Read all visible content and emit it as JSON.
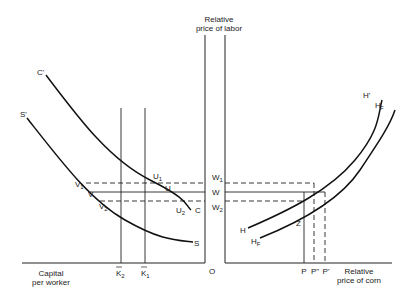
{
  "diagram": {
    "axes": {
      "vertical_label_line1": "Relative",
      "vertical_label_line2": "price of labor",
      "left_x_label_line1": "Capital",
      "left_x_label_line2": "per worker",
      "right_x_label_line1": "Relative",
      "right_x_label_line2": "price of corn",
      "origin": "O"
    },
    "curves": {
      "C_prime": "C'",
      "C": "C",
      "S_prime": "S'",
      "S": "S",
      "H_prime": "H'",
      "H": "H",
      "HF_prime_base": "H",
      "HF_prime_sub": "F",
      "HF_prime_sup": "'",
      "HF_base": "H",
      "HF_sub": "F"
    },
    "points": {
      "U1": "U",
      "U1_sub": "1",
      "U": "U",
      "U2": "U",
      "U2_sub": "2",
      "V1": "V",
      "V1_sub": "1",
      "V": "V",
      "V2": "V",
      "V2_sub": "2",
      "Z": "Z"
    },
    "wage_levels": {
      "W1": "W",
      "W1_sub": "1",
      "W": "W",
      "W2": "W",
      "W2_sub": "2"
    },
    "capital_levels": {
      "K2": "K",
      "K2_sub": "2",
      "K1": "K",
      "K1_sub": "1"
    },
    "price_levels": {
      "P": "P",
      "P_double_prime": "P\"",
      "P_prime": "P'"
    }
  }
}
